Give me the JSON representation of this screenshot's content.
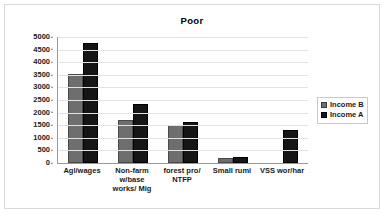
{
  "chart_data": {
    "type": "bar",
    "title": "Poor",
    "xlabel": "",
    "ylabel": "",
    "ylim": [
      0,
      5000
    ],
    "ytick_step": 500,
    "yticks": [
      "5000",
      "4500",
      "4000",
      "3500",
      "3000",
      "2500",
      "2000",
      "1500",
      "1000",
      "500",
      "0"
    ],
    "grid": true,
    "legend_position": "right",
    "categories": [
      "Agl/wages",
      "Non-farm w/base works/ Mig",
      "forest pro/ NTFP",
      "Small rumi",
      "VSS wor/har"
    ],
    "series": [
      {
        "name": "Income B",
        "color": "#6e6e6e",
        "values": [
          3520,
          1700,
          1510,
          180,
          0
        ]
      },
      {
        "name": "Income A",
        "color": "#151515",
        "values": [
          4750,
          2350,
          1610,
          250,
          1320
        ]
      }
    ]
  },
  "legend": {
    "items": [
      {
        "label": "Income B"
      },
      {
        "label": "Income A"
      }
    ]
  }
}
